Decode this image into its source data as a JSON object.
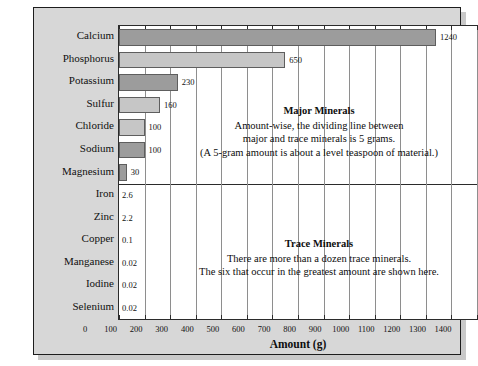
{
  "chart_data": {
    "type": "bar",
    "orientation": "horizontal",
    "title": "",
    "xlabel": "Amount (g)",
    "ylabel": "",
    "xlim": [
      0,
      1400
    ],
    "xticks": [
      0,
      100,
      200,
      300,
      400,
      500,
      600,
      700,
      800,
      900,
      1000,
      1100,
      1200,
      1300,
      1400
    ],
    "grid": true,
    "grid_axis": "x",
    "categories": [
      "Calcium",
      "Phosphorus",
      "Potassium",
      "Sulfur",
      "Chloride",
      "Sodium",
      "Magnesium",
      "Iron",
      "Zinc",
      "Copper",
      "Manganese",
      "Iodine",
      "Selenium"
    ],
    "values": [
      1240,
      650,
      230,
      160,
      100,
      100,
      30,
      2.6,
      2.2,
      0.1,
      0.02,
      0.02,
      0.02
    ],
    "value_labels": [
      "1240",
      "650",
      "230",
      "160",
      "100",
      "100",
      "30",
      "2.6",
      "2.2",
      "0.1",
      "0.02",
      "0.02",
      "0.02"
    ],
    "bar_shades": [
      "dark",
      "light",
      "dark",
      "light",
      "light",
      "dark",
      "dark",
      "none",
      "none",
      "none",
      "none",
      "none",
      "none"
    ],
    "groups": [
      {
        "name": "Major Minerals",
        "members": [
          "Calcium",
          "Phosphorus",
          "Potassium",
          "Sulfur",
          "Chloride",
          "Sodium",
          "Magnesium"
        ]
      },
      {
        "name": "Trace Minerals",
        "members": [
          "Iron",
          "Zinc",
          "Copper",
          "Manganese",
          "Iodine",
          "Selenium"
        ]
      }
    ],
    "annotations": [
      {
        "id": "major",
        "heading": "Major Minerals",
        "lines": [
          "Amount-wise, the dividing line between",
          "major and trace minerals is 5 grams.",
          "(A 5-gram amount is about a level teaspoon of material.)"
        ]
      },
      {
        "id": "trace",
        "heading": "Trace Minerals",
        "lines": [
          "There are more than a dozen trace minerals.",
          "The six that occur in the greatest amount are shown here."
        ]
      }
    ],
    "colors": {
      "bar_dark": "#9c9c9c",
      "bar_light": "#c6c6c6",
      "bar_outline": "#5e5e5e",
      "panel_background": "#d7d7d7",
      "plot_background": "#ffffff",
      "gridline": "#8e8e8e",
      "frame": "#2b2b2b",
      "text": "#0d0d0d"
    }
  }
}
